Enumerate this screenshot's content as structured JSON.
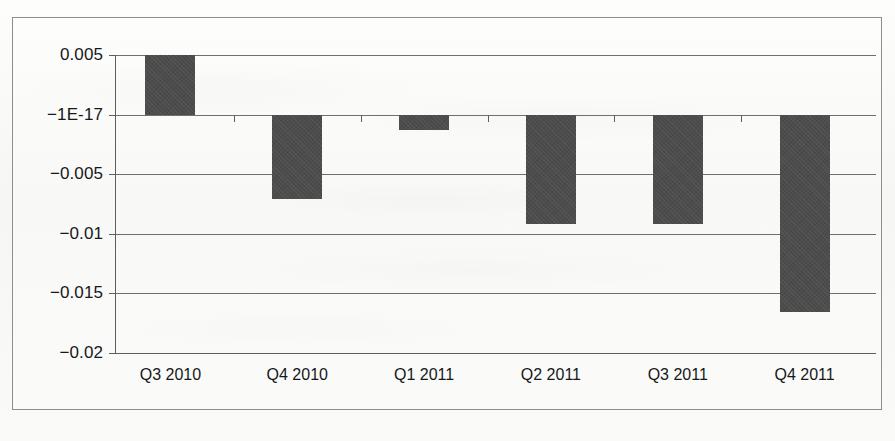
{
  "chart_data": {
    "type": "bar",
    "title": "",
    "subtitle": "",
    "xlabel": "",
    "ylabel": "",
    "categories": [
      "Q3 2010",
      "Q4 2010",
      "Q1 2011",
      "Q2 2011",
      "Q3 2011",
      "Q4 2011"
    ],
    "values": [
      0.005,
      -0.0071,
      -0.0013,
      -0.0092,
      -0.0092,
      -0.0166
    ],
    "ylim": [
      -0.02,
      0.005
    ],
    "ytick_values": [
      0.005,
      0,
      -0.005,
      -0.01,
      -0.015,
      -0.02
    ],
    "ytick_labels": [
      "0.005",
      "−1E-17",
      "−0.005",
      "−0.01",
      "−0.015",
      "−0.02"
    ],
    "grid": true,
    "legend": false,
    "legend_position": "none",
    "annotations": [],
    "series": [
      {
        "name": "",
        "values": [
          0.005,
          -0.0071,
          -0.0013,
          -0.0092,
          -0.0092,
          -0.0166
        ],
        "color": "#4c4c4c"
      }
    ]
  },
  "style": {
    "bar_color": "#4c4c4c",
    "axis_color": "#5e5e5e",
    "grid_color": "#6f6f6f",
    "frame_color": "#8d8d8d",
    "text_color": "#16181a",
    "page_background": "#fbfbfa"
  }
}
